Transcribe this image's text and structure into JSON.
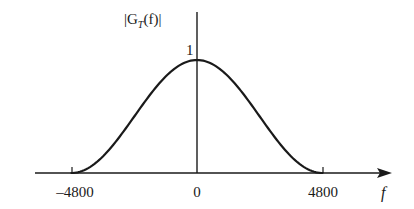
{
  "chart_data": {
    "type": "line",
    "title": "",
    "ylabel": "|G_T(f)|",
    "ylabel_parts": {
      "open": "|G",
      "sub": "T",
      "close": "(f)|"
    },
    "xlabel": "f",
    "x_ticks": [
      "-4800",
      "0",
      "4800"
    ],
    "x_tick_display": [
      "–4800",
      "0",
      "4800"
    ],
    "y_ticks": [
      "1"
    ],
    "xlim": [
      -5800,
      8000
    ],
    "ylim": [
      0,
      1
    ],
    "grid": false,
    "legend": null,
    "series": [
      {
        "name": "|G_T(f)|",
        "description": "raised-cosine shaped magnitude spectrum, cos^2(pi f / 9600) for |f| <= 4800, zero otherwise",
        "x": [
          -4800,
          -4000,
          -3200,
          -2400,
          -1600,
          -800,
          0,
          800,
          1600,
          2400,
          3200,
          4000,
          4800
        ],
        "values": [
          0.0,
          0.067,
          0.25,
          0.5,
          0.75,
          0.933,
          1.0,
          0.933,
          0.75,
          0.5,
          0.25,
          0.067,
          0.0
        ]
      }
    ]
  },
  "colors": {
    "stroke": "#1a1a1a",
    "background": "#ffffff"
  }
}
